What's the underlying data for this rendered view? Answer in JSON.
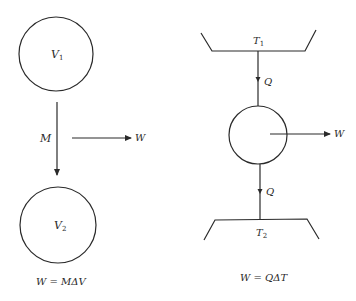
{
  "diagram": {
    "colors": {
      "line": "#2a2a2a",
      "background": "#ffffff"
    },
    "left": {
      "top_circle_label": "V",
      "top_circle_sub": "1",
      "flow_label": "M",
      "work_label": "W",
      "bottom_circle_label": "V",
      "bottom_circle_sub": "2",
      "formula": "W = MΔV"
    },
    "right": {
      "hot_reservoir_label": "T",
      "hot_reservoir_sub": "1",
      "heat_in_label": "Q",
      "work_label": "W",
      "heat_out_label": "Q",
      "cold_reservoir_label": "T",
      "cold_reservoir_sub": "2",
      "formula": "W = QΔT"
    }
  }
}
